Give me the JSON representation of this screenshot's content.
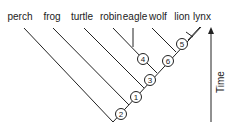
{
  "diagram": {
    "type": "cladogram",
    "taxa": [
      "perch",
      "frog",
      "turtle",
      "robin",
      "eagle",
      "wolf",
      "lion",
      "lynx"
    ],
    "nodes": [
      "2",
      "1",
      "3",
      "4",
      "6",
      "5"
    ],
    "axis_label": "Time"
  }
}
